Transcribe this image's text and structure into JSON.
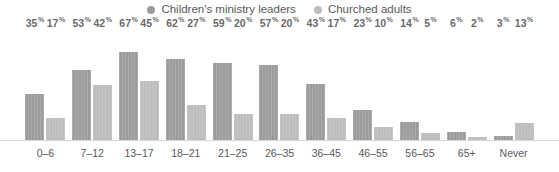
{
  "legend": {
    "items": [
      {
        "label": "Children's ministry leaders",
        "color": "#9b9b9b",
        "icon": "legend-dot-icon"
      },
      {
        "label": "Churched adults",
        "color": "#bdbdbd",
        "icon": "legend-dot-icon"
      }
    ]
  },
  "axis": {
    "categories": [
      "0–6",
      "7–12",
      "13–17",
      "18–21",
      "21–25",
      "26–35",
      "36–45",
      "46–55",
      "56–65",
      "65+",
      "Never"
    ]
  },
  "value_suffix": "%",
  "chart_data": {
    "type": "bar",
    "title": "",
    "subtitle": "",
    "xlabel": "",
    "ylabel": "",
    "ylim": [
      0,
      70
    ],
    "grid": false,
    "legend_position": "top-center",
    "categories": [
      "0–6",
      "7–12",
      "13–17",
      "18–21",
      "21–25",
      "26–35",
      "36–45",
      "46–55",
      "56–65",
      "65+",
      "Never"
    ],
    "series": [
      {
        "name": "Children's ministry leaders",
        "color": "#9b9b9b",
        "values": [
          35,
          53,
          67,
          62,
          59,
          57,
          43,
          23,
          14,
          6,
          3
        ],
        "labels": [
          "35%",
          "53%",
          "67%",
          "62%",
          "59%",
          "57%",
          "43%",
          "23%",
          "14%",
          "6%",
          "3%"
        ]
      },
      {
        "name": "Churched adults",
        "color": "#bdbdbd",
        "values": [
          17,
          42,
          45,
          27,
          20,
          20,
          17,
          10,
          5,
          2,
          13
        ],
        "labels": [
          "17%",
          "42%",
          "45%",
          "27%",
          "20%",
          "20%",
          "17%",
          "10%",
          "5%",
          "2%",
          "13%"
        ]
      }
    ]
  }
}
